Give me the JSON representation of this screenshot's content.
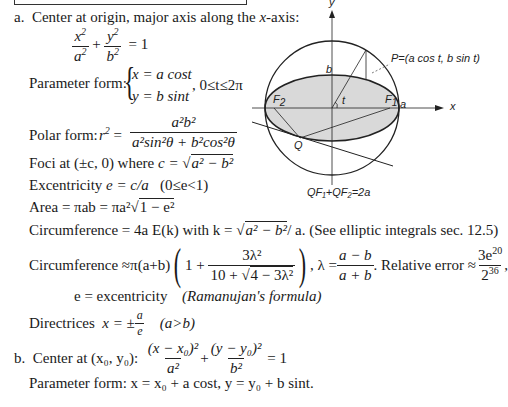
{
  "section_a": {
    "label": "a.",
    "heading": "Center at origin, major axis along the ",
    "heading_var": "x",
    "heading_end": "-axis:",
    "equation": {
      "num1": "x",
      "den1": "a",
      "num2": "y",
      "den2": "b",
      "exp": "2",
      "plus": "+",
      "eq": "= 1"
    },
    "parameter_form": {
      "label": "Parameter form:",
      "line1": "x = a cost",
      "line2": "y = b sint",
      "range": ",  0≤t≤2π"
    },
    "polar_form": {
      "label": "Polar form:",
      "lhs": "r",
      "num": "a²b²",
      "den": "a²sin²θ + b²cos²θ"
    },
    "foci": {
      "text": "Foci at (±c, 0) where ",
      "c_eq": "c = ",
      "root": "a² − b²"
    },
    "excentricity": {
      "text": "Excentricity ",
      "formula": "e = c/a",
      "range": "(0≤e<1)"
    },
    "area": {
      "text": "Area = πab = πa²",
      "root": "1 − e²"
    },
    "circumference_exact": {
      "prefix": "Circumference = 4a E(k) with k = ",
      "root": "a² − b²",
      "suffix": "/ a.  (See elliptic integrals sec. 12.5)"
    },
    "circumference_approx": {
      "prefix": "Circumference ≈π(a+b)",
      "one_plus": "1 +",
      "num": "3λ²",
      "den_prefix": "10 + ",
      "den_root": "4 − 3λ²",
      "lambda_eq": ", λ = ",
      "lambda_num": "a − b",
      "lambda_den": "a + b",
      "rel_err": ". Relative error ≈",
      "err_num": "3e",
      "err_num_exp": "20",
      "err_den": "2",
      "err_den_exp": "36",
      "tail": ","
    },
    "e_note": "e = excentricity",
    "ramanujan": "(Ramanujan's formula)",
    "directrices": {
      "label": "Directrices",
      "eq": "x = ±",
      "num": "a",
      "den": "e",
      "cond": "(a>b)"
    }
  },
  "section_b": {
    "label": "b.",
    "heading": "Center at (x₀, y₀):",
    "num1": "(x − x₀)²",
    "den1": "a²",
    "num2": "(y − y₀)²",
    "den2": "b²",
    "plus": "+",
    "eq": "= 1",
    "parameter_form": "Parameter form:  x = x₀ + a cost,  y = y₀ + b sint."
  },
  "diagram": {
    "y_label": "y",
    "x_label": "x",
    "b_label": "b",
    "a_label": "a",
    "t_label": "t",
    "F1_label": "F",
    "F1_sub": "1",
    "F2_label": "F",
    "F2_sub": "2",
    "Q_label": "Q",
    "P_label": "P=(a cos t, b sin t)",
    "caption": "QF₁+QF₂=2a",
    "fill_color": "#d9d9d9",
    "stroke_color": "#222222"
  }
}
